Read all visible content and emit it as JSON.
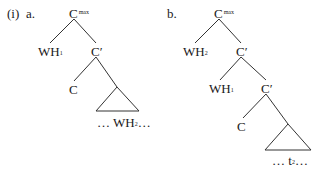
{
  "example": {
    "number": "(i)",
    "a": {
      "label": "a.",
      "root": {
        "base": "C",
        "sup": "max"
      },
      "spec": {
        "base": "WH",
        "sub": "1"
      },
      "cbar": "C′",
      "head": "C",
      "triangle_text": {
        "pre": "… WH",
        "sub": "2",
        "post": "…"
      }
    },
    "b": {
      "label": "b.",
      "root": {
        "base": "C",
        "sup": "max"
      },
      "spec": {
        "base": "WH",
        "sub": "2"
      },
      "cbar": "C′",
      "spec2": {
        "base": "WH",
        "sub": "1"
      },
      "cbar2": "C′",
      "head": "C",
      "triangle_text": {
        "pre": "… t",
        "sub": "2",
        "post": "…"
      }
    }
  }
}
